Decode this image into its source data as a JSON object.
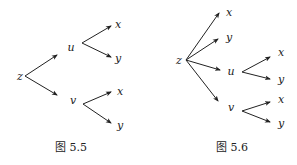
{
  "figures": [
    {
      "caption": "图 5.5",
      "root": "z",
      "nodes": [
        {
          "id": "z",
          "label": "z",
          "x": 20,
          "y": 76
        },
        {
          "id": "u",
          "label": "u",
          "x": 71,
          "y": 47
        },
        {
          "id": "v",
          "label": "v",
          "x": 73,
          "y": 100
        },
        {
          "id": "ux",
          "label": "x",
          "x": 118,
          "y": 24
        },
        {
          "id": "uy",
          "label": "y",
          "x": 118,
          "y": 58
        },
        {
          "id": "vx",
          "label": "x",
          "x": 120,
          "y": 91
        },
        {
          "id": "vy",
          "label": "y",
          "x": 120,
          "y": 125
        }
      ],
      "edges": [
        {
          "from": "z",
          "to": "u",
          "x1": 25,
          "y1": 76,
          "x2": 57,
          "y2": 55
        },
        {
          "from": "z",
          "to": "v",
          "x1": 25,
          "y1": 76,
          "x2": 57,
          "y2": 95
        },
        {
          "from": "u",
          "to": "x",
          "x1": 82,
          "y1": 43,
          "x2": 111,
          "y2": 26
        },
        {
          "from": "u",
          "to": "y",
          "x1": 82,
          "y1": 43,
          "x2": 111,
          "y2": 57
        },
        {
          "from": "v",
          "to": "x",
          "x1": 83,
          "y1": 104,
          "x2": 111,
          "y2": 92
        },
        {
          "from": "v",
          "to": "y",
          "x1": 83,
          "y1": 104,
          "x2": 111,
          "y2": 123
        }
      ],
      "caption_pos": {
        "x": 71,
        "y": 147
      }
    },
    {
      "caption": "图 5.6",
      "root": "z",
      "nodes": [
        {
          "id": "z",
          "label": "z",
          "x": 179,
          "y": 60
        },
        {
          "id": "x",
          "label": "x",
          "x": 229,
          "y": 12
        },
        {
          "id": "y",
          "label": "y",
          "x": 229,
          "y": 37
        },
        {
          "id": "u",
          "label": "u",
          "x": 231,
          "y": 71
        },
        {
          "id": "v",
          "label": "v",
          "x": 231,
          "y": 107
        },
        {
          "id": "ux",
          "label": "x",
          "x": 281,
          "y": 52
        },
        {
          "id": "uy",
          "label": "y",
          "x": 281,
          "y": 79
        },
        {
          "id": "vx",
          "label": "x",
          "x": 281,
          "y": 99
        },
        {
          "id": "vy",
          "label": "y",
          "x": 281,
          "y": 123
        }
      ],
      "edges": [
        {
          "from": "z",
          "to": "x",
          "x1": 186,
          "y1": 60,
          "x2": 219,
          "y2": 13
        },
        {
          "from": "z",
          "to": "y",
          "x1": 186,
          "y1": 60,
          "x2": 218,
          "y2": 39
        },
        {
          "from": "z",
          "to": "u",
          "x1": 186,
          "y1": 60,
          "x2": 220,
          "y2": 70
        },
        {
          "from": "z",
          "to": "v",
          "x1": 186,
          "y1": 60,
          "x2": 218,
          "y2": 101
        },
        {
          "from": "u",
          "to": "x",
          "x1": 242,
          "y1": 72,
          "x2": 270,
          "y2": 57
        },
        {
          "from": "u",
          "to": "y",
          "x1": 242,
          "y1": 72,
          "x2": 270,
          "y2": 79
        },
        {
          "from": "v",
          "to": "x",
          "x1": 242,
          "y1": 111,
          "x2": 270,
          "y2": 102
        },
        {
          "from": "v",
          "to": "y",
          "x1": 242,
          "y1": 111,
          "x2": 270,
          "y2": 122
        }
      ],
      "caption_pos": {
        "x": 232,
        "y": 147
      }
    }
  ]
}
